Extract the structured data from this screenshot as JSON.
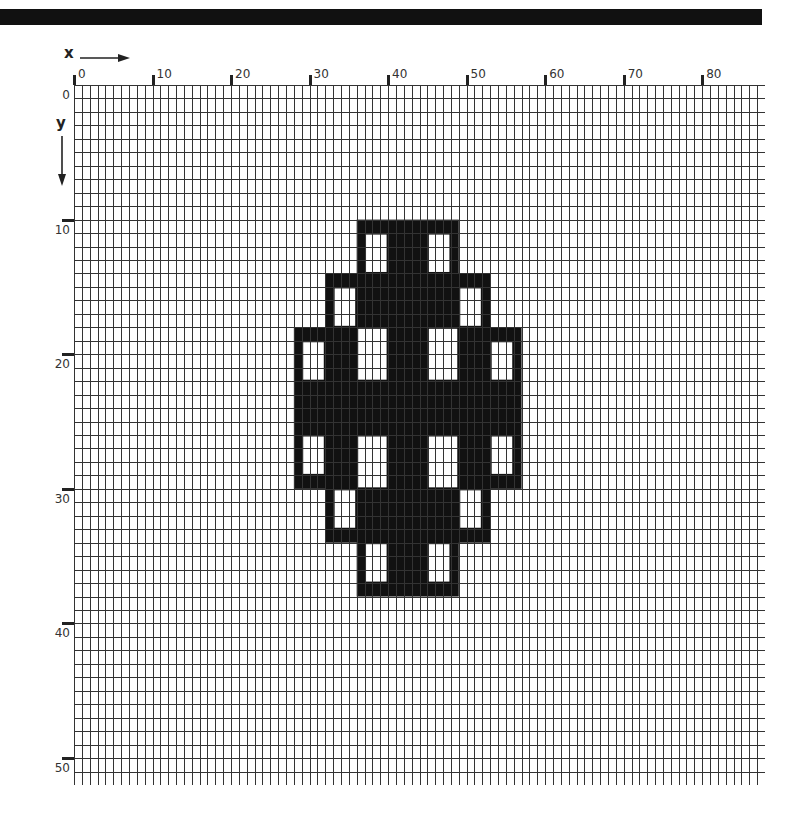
{
  "header": {
    "bar_color": "#111111"
  },
  "axes": {
    "x_label": "x",
    "y_label": "y",
    "x_ticks": [
      {
        "label": "0",
        "value": 0
      },
      {
        "label": "10",
        "value": 10
      },
      {
        "label": "20",
        "value": 20
      },
      {
        "label": "30",
        "value": 30
      },
      {
        "label": "40",
        "value": 40
      },
      {
        "label": "50",
        "value": 50
      },
      {
        "label": "60",
        "value": 60
      },
      {
        "label": "70",
        "value": 70
      },
      {
        "label": "80",
        "value": 80
      }
    ],
    "y_ticks": [
      {
        "label": "0",
        "value": 0
      },
      {
        "label": "10",
        "value": 10
      },
      {
        "label": "20",
        "value": 20
      },
      {
        "label": "30",
        "value": 30
      },
      {
        "label": "40",
        "value": 40
      },
      {
        "label": "50",
        "value": 50
      }
    ]
  },
  "grid": {
    "columns": 88,
    "rows": 52,
    "line_color": "#333333",
    "fill_color": "#111111"
  },
  "shape": {
    "description": "Symmetric pixelated pattern of filled cells with white window openings",
    "filled_blocks": [
      {
        "name": "top-tier",
        "col": 36,
        "row": 10,
        "w": 13,
        "h": 28
      },
      {
        "name": "middle-tier",
        "col": 32,
        "row": 14,
        "w": 21,
        "h": 20
      },
      {
        "name": "wide-tier",
        "col": 28,
        "row": 18,
        "w": 29,
        "h": 12
      }
    ],
    "windows": [
      {
        "col": 37,
        "row": 11,
        "w": 3,
        "h": 3
      },
      {
        "col": 45,
        "row": 11,
        "w": 3,
        "h": 3
      },
      {
        "col": 33,
        "row": 15,
        "w": 3,
        "h": 3
      },
      {
        "col": 49,
        "row": 15,
        "w": 3,
        "h": 3
      },
      {
        "col": 29,
        "row": 19,
        "w": 3,
        "h": 3
      },
      {
        "col": 53,
        "row": 19,
        "w": 3,
        "h": 3
      },
      {
        "col": 36,
        "row": 18,
        "w": 4,
        "h": 4
      },
      {
        "col": 45,
        "row": 18,
        "w": 4,
        "h": 4
      },
      {
        "col": 29,
        "row": 26,
        "w": 3,
        "h": 3
      },
      {
        "col": 53,
        "row": 26,
        "w": 3,
        "h": 3
      },
      {
        "col": 36,
        "row": 26,
        "w": 4,
        "h": 4
      },
      {
        "col": 45,
        "row": 26,
        "w": 4,
        "h": 4
      },
      {
        "col": 33,
        "row": 30,
        "w": 3,
        "h": 3
      },
      {
        "col": 49,
        "row": 30,
        "w": 3,
        "h": 3
      },
      {
        "col": 37,
        "row": 34,
        "w": 3,
        "h": 3
      },
      {
        "col": 45,
        "row": 34,
        "w": 3,
        "h": 3
      }
    ]
  }
}
